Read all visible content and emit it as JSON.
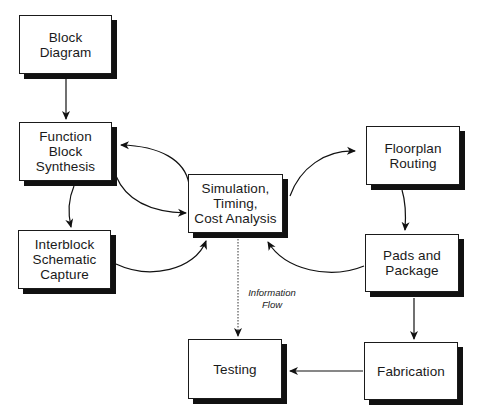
{
  "diagram": {
    "nodes": [
      {
        "id": "block-diagram",
        "label": "Block\nDiagram"
      },
      {
        "id": "function-block-synthesis",
        "label": "Function\nBlock\nSynthesis"
      },
      {
        "id": "interblock-schematic-capture",
        "label": "Interblock\nSchematic\nCapture"
      },
      {
        "id": "simulation-timing-cost-analysis",
        "label": "Simulation,\nTiming,\nCost Analysis"
      },
      {
        "id": "floorplan-routing",
        "label": "Floorplan\nRouting"
      },
      {
        "id": "pads-and-package",
        "label": "Pads and\nPackage"
      },
      {
        "id": "fabrication",
        "label": "Fabrication"
      },
      {
        "id": "testing",
        "label": "Testing"
      }
    ],
    "edges": [
      {
        "from": "block-diagram",
        "to": "function-block-synthesis",
        "style": "solid"
      },
      {
        "from": "simulation-timing-cost-analysis",
        "to": "function-block-synthesis",
        "style": "solid-curved"
      },
      {
        "from": "function-block-synthesis",
        "to": "simulation-timing-cost-analysis",
        "style": "solid-curved"
      },
      {
        "from": "function-block-synthesis",
        "to": "interblock-schematic-capture",
        "style": "solid-curved"
      },
      {
        "from": "interblock-schematic-capture",
        "to": "simulation-timing-cost-analysis",
        "style": "solid-curved"
      },
      {
        "from": "simulation-timing-cost-analysis",
        "to": "floorplan-routing",
        "style": "solid-curved"
      },
      {
        "from": "floorplan-routing",
        "to": "pads-and-package",
        "style": "solid-curved"
      },
      {
        "from": "pads-and-package",
        "to": "simulation-timing-cost-analysis",
        "style": "solid-curved"
      },
      {
        "from": "pads-and-package",
        "to": "fabrication",
        "style": "solid"
      },
      {
        "from": "fabrication",
        "to": "testing",
        "style": "solid"
      },
      {
        "from": "simulation-timing-cost-analysis",
        "to": "testing",
        "style": "dotted",
        "label": "Information\nFlow"
      }
    ],
    "annotations": {
      "information_flow": "Information\nFlow"
    }
  }
}
